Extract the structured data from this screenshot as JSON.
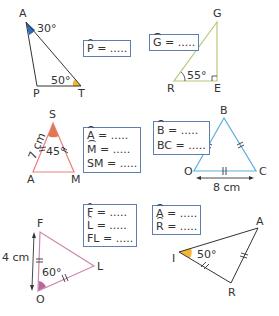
{
  "exercise": {
    "figures": [
      {
        "id": "APT",
        "vertices": [
          "A",
          "P",
          "T"
        ],
        "given_angles": [
          {
            "vertex": "A",
            "value": "30°",
            "color": "#2b6fc0"
          },
          {
            "vertex": "T",
            "value": "50°",
            "color": "#f2b630"
          }
        ],
        "question_rows": [
          {
            "name": "P",
            "type": "angle",
            "text": " = ....."
          }
        ]
      },
      {
        "id": "GRE",
        "vertices": [
          "G",
          "R",
          "E"
        ],
        "given_angles": [
          {
            "vertex": "R",
            "value": "55°"
          }
        ],
        "right_angle_at": "E",
        "line_color": "#b8c87a",
        "question_rows": [
          {
            "name": "G",
            "type": "angle",
            "text": " = ....."
          }
        ]
      },
      {
        "id": "SAM",
        "vertices": [
          "S",
          "A",
          "M"
        ],
        "given_angles": [
          {
            "vertex": "S",
            "value": "45°",
            "color": "#e0784e"
          }
        ],
        "side_label": "7 cm",
        "line_color": "#e88080",
        "question_rows": [
          {
            "name": "A",
            "type": "angle",
            "text": " = ....."
          },
          {
            "name": "M",
            "type": "angle",
            "text": " = ....."
          },
          {
            "name": "SM",
            "type": "length",
            "text": " = ....."
          }
        ]
      },
      {
        "id": "BOC",
        "vertices": [
          "B",
          "O",
          "C"
        ],
        "side_label": "8 cm",
        "line_color": "#5bb0e0",
        "question_rows": [
          {
            "name": "B",
            "type": "angle",
            "text": " = ....."
          },
          {
            "name": "BC",
            "type": "length",
            "text": " = ....."
          }
        ]
      },
      {
        "id": "FOL",
        "vertices": [
          "F",
          "O",
          "L"
        ],
        "given_angles": [
          {
            "vertex": "O",
            "value": "60°",
            "color": "#b56a9a"
          }
        ],
        "side_label": "4 cm",
        "line_color": "#c88ab0",
        "question_rows": [
          {
            "name": "F",
            "type": "angle",
            "text": " = ....."
          },
          {
            "name": "L",
            "type": "angle",
            "text": " = ....."
          },
          {
            "name": "FL",
            "type": "length",
            "text": " = ....."
          }
        ]
      },
      {
        "id": "IAR",
        "vertices": [
          "I",
          "A",
          "R"
        ],
        "given_angles": [
          {
            "vertex": "I",
            "value": "50°",
            "color": "#f2b630"
          }
        ],
        "question_rows": [
          {
            "name": "A",
            "type": "angle",
            "text": " = ....."
          },
          {
            "name": "R",
            "type": "angle",
            "text": " = ....."
          }
        ]
      }
    ]
  },
  "labels": {
    "A1": "A",
    "P1": "P",
    "T1": "T",
    "a30": "30°",
    "a50": "50°",
    "G2": "G",
    "R2": "R",
    "E2": "E",
    "a55": "55°",
    "S3": "S",
    "A3": "A",
    "M3": "M",
    "a45": "45°",
    "s7": "7 cm",
    "B4": "B",
    "O4": "O",
    "C4": "C",
    "s8": "8 cm",
    "F5": "F",
    "O5": "O",
    "L5": "L",
    "a60": "60°",
    "s4": "4 cm",
    "I6": "I",
    "A6": "A",
    "R6": "R",
    "a50b": "50°"
  },
  "boxes": {
    "p": {
      "v": "P",
      "t": " = ....."
    },
    "g": {
      "v": "G",
      "t": " = ....."
    },
    "a3": {
      "v": "A",
      "t": " = ....."
    },
    "m3": {
      "v": "M",
      "t": " = ....."
    },
    "sm3": {
      "v": "SM",
      "t": " = ....."
    },
    "b4": {
      "v": "B",
      "t": " = ....."
    },
    "bc4": {
      "v": "BC",
      "t": " = ....."
    },
    "f5": {
      "v": "F",
      "t": " = ....."
    },
    "l5": {
      "v": "L",
      "t": " = ....."
    },
    "fl5": {
      "v": "FL",
      "t": " = ....."
    },
    "a6": {
      "v": "A",
      "t": " = ....."
    },
    "r6": {
      "v": "R",
      "t": " = ....."
    }
  }
}
